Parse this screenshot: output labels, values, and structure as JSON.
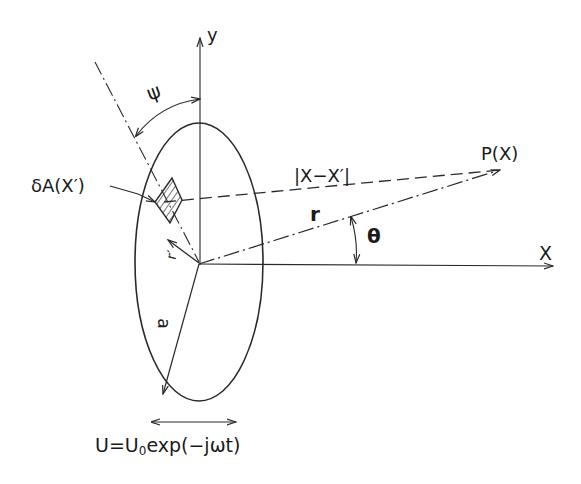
{
  "diagram": {
    "type": "geometry-figure",
    "labels": {
      "y_axis": "y",
      "x_axis": "X",
      "angle_psi": "ψ",
      "area_element": "δA(X′)",
      "distance": "|X−X′|",
      "field_point": "P(X)",
      "radius_r": "r",
      "angle_theta": "θ",
      "radius_r_prime": "r′",
      "semi_axis": "a",
      "velocity_formula_prefix": "U=U",
      "velocity_formula_sub": "0",
      "velocity_formula_suffix": "exp(−jωt)"
    },
    "colors": {
      "stroke": "#2a2a2a",
      "background": "#ffffff"
    }
  }
}
